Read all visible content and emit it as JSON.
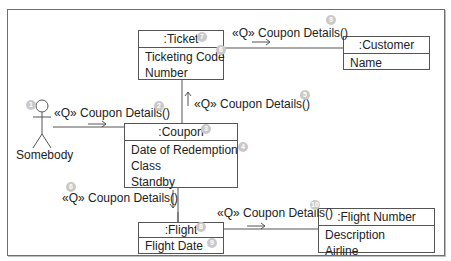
{
  "actor": {
    "name": "Somebody",
    "badge": "1"
  },
  "objects": {
    "ticket": {
      "title": ":Ticket",
      "attributes": [
        "Ticketing Code",
        "Number"
      ],
      "title_badge": "7",
      "attr_badge": "6"
    },
    "customer": {
      "title": ":Customer",
      "attributes": [
        "Name"
      ]
    },
    "coupon": {
      "title": ":Coupon",
      "attributes": [
        "Date of Redemption",
        "Class",
        "Standby"
      ],
      "title_badge": "3",
      "attr_badge": "4"
    },
    "flight": {
      "title": ":Flight",
      "attributes": [
        "Flight Date"
      ],
      "title_badge": "8",
      "attr_badge": "9"
    },
    "flight_number": {
      "title": ":Flight Number",
      "attributes": [
        "Description",
        "Airline"
      ]
    }
  },
  "messages": {
    "actor_to_coupon": {
      "label": "«Q» Coupon Details()",
      "badge": "2"
    },
    "coupon_to_ticket": {
      "label": "«Q» Coupon Details()",
      "badge": "5"
    },
    "ticket_to_customer": {
      "label": "«Q» Coupon Details()",
      "badge": "9"
    },
    "coupon_to_flight": {
      "label": "«Q» Coupon Details()",
      "badge": "6"
    },
    "flight_to_flight_number": {
      "label": "«Q» Coupon Details()",
      "badge": "10"
    }
  },
  "colors": {
    "line": "#555555",
    "badge": "#c9c9c9",
    "frame": "#6e6e6e"
  }
}
